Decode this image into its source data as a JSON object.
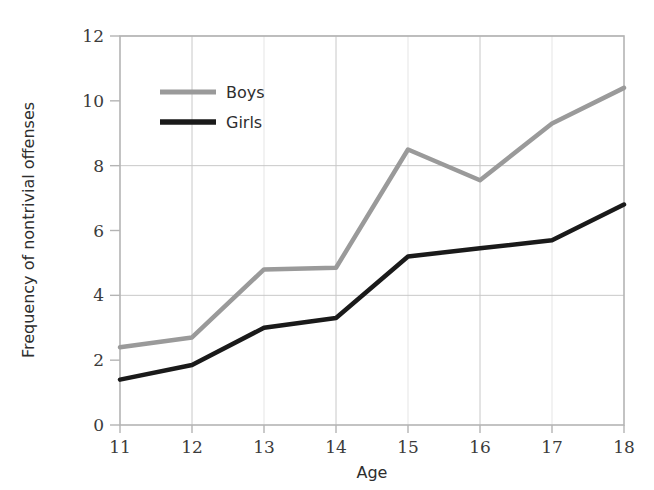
{
  "chart_data": {
    "type": "line",
    "title": "",
    "xlabel": "Age",
    "ylabel": "Frequency of nontrivial offenses",
    "x": [
      11,
      12,
      13,
      14,
      15,
      16,
      17,
      18
    ],
    "categories": [
      "11",
      "12",
      "13",
      "14",
      "15",
      "16",
      "17",
      "18"
    ],
    "xtick_labels": [
      "11",
      "12",
      "13",
      "14",
      "15",
      "16",
      "17",
      "18"
    ],
    "ytick_labels": [
      "0",
      "2",
      "4",
      "6",
      "8",
      "10",
      "12"
    ],
    "yticks": [
      0,
      2,
      4,
      6,
      8,
      10,
      12
    ],
    "xlim": [
      11,
      18
    ],
    "ylim": [
      0,
      12
    ],
    "grid": true,
    "grid_horizontal_values": [
      4,
      8,
      12
    ],
    "grid_vertical_values": [
      12,
      13,
      14,
      15,
      16,
      17
    ],
    "legend_position": "upper-left-inside",
    "series": [
      {
        "name": "Boys",
        "color": "#9a9a9a",
        "values": [
          2.4,
          2.7,
          4.8,
          4.85,
          8.5,
          7.55,
          9.3,
          10.4
        ]
      },
      {
        "name": "Girls",
        "color": "#1a1a1a",
        "values": [
          1.4,
          1.85,
          3.0,
          3.3,
          5.2,
          5.45,
          5.7,
          6.8
        ]
      }
    ]
  },
  "legend": {
    "entries": [
      {
        "label": "Boys",
        "color": "#9a9a9a"
      },
      {
        "label": "Girls",
        "color": "#1a1a1a"
      }
    ]
  },
  "axes": {
    "x_title": "Age",
    "y_title": "Frequency of nontrivial offenses"
  },
  "colors": {
    "boys": "#9a9a9a",
    "girls": "#1a1a1a",
    "grid": "#c8c8c8",
    "frame": "#b4b4b4",
    "tick_text": "#3b3b3b",
    "background": "#ffffff"
  }
}
